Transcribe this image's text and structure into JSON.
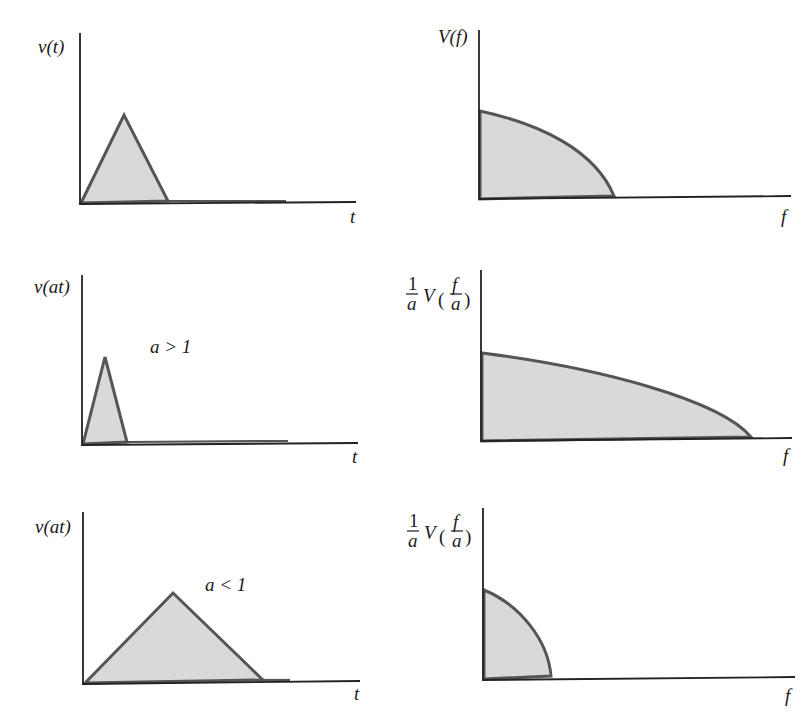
{
  "figure": {
    "panels": [
      {
        "id": "time-original",
        "y_label": "v(t)",
        "x_label": "t",
        "annotation": "",
        "shape": "triangle pulse"
      },
      {
        "id": "freq-original",
        "y_label": "V(f)",
        "x_label": "f",
        "annotation": "",
        "shape": "decreasing spectrum"
      },
      {
        "id": "time-compressed",
        "y_label": "v(at)",
        "x_label": "t",
        "annotation": "a > 1",
        "shape": "narrow triangle pulse"
      },
      {
        "id": "freq-expanded",
        "y_label_prefix": "1",
        "y_label_prefix_den": "a",
        "y_label_fn": "V",
        "y_label_arg_num": "f",
        "y_label_arg_den": "a",
        "x_label": "f",
        "annotation": "",
        "shape": "wide spectrum"
      },
      {
        "id": "time-expanded",
        "y_label": "v(at)",
        "x_label": "t",
        "annotation": "a < 1",
        "shape": "wide triangle pulse"
      },
      {
        "id": "freq-compressed",
        "y_label_prefix": "1",
        "y_label_prefix_den": "a",
        "y_label_fn": "V",
        "y_label_arg_num": "f",
        "y_label_arg_den": "a",
        "x_label": "f",
        "annotation": "",
        "shape": "narrow spectrum"
      }
    ],
    "colors": {
      "fill": "#d9d9d9",
      "outline": "#555555",
      "axis": "#222222"
    }
  }
}
